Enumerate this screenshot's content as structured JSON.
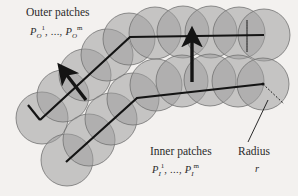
{
  "figure": {
    "background_color": "#f3f1ef",
    "circle_fill": "#9e9e9e",
    "circle_stroke": "#6e6e6e",
    "line_color": "#141414",
    "text_color": "#2b2b2b"
  },
  "labels": {
    "outer_title": "Outer patches",
    "outer_formula": {
      "base": "P",
      "sub": "O",
      "sup_first": "1",
      "dots": ", ..., ",
      "sup_last": "m"
    },
    "inner_title": "Inner patches",
    "inner_formula": {
      "base": "P",
      "sub": "I",
      "sup_first": "1",
      "dots": ", ..., ",
      "sup_last": "m"
    },
    "radius_title": "Radius",
    "radius_symbol": "r"
  },
  "chart_data": {
    "type": "scatter",
    "xlabel": "",
    "ylabel": "",
    "xlim": [
      0,
      298
    ],
    "ylim": [
      0,
      196
    ],
    "grid": false,
    "legend": "none",
    "radius": 26,
    "series": [
      {
        "name": "Outer patches",
        "note": "Upper/outer chain of circle centers, running from lower-left diagonally up then horizontally right",
        "centers": [
          [
            42,
            118
          ],
          [
            63,
            96
          ],
          [
            85,
            75
          ],
          [
            107,
            55
          ],
          [
            129,
            39
          ],
          [
            155,
            33
          ],
          [
            183,
            32
          ],
          [
            211,
            32
          ],
          [
            239,
            33
          ],
          [
            264,
            35
          ]
        ]
      },
      {
        "name": "Inner patches",
        "note": "Lower/inner chain of circle centers, parallel and offset inward from the outer chain",
        "centers": [
          [
            67,
            160
          ],
          [
            89,
            140
          ],
          [
            111,
            119
          ],
          [
            133,
            99
          ],
          [
            156,
            85
          ],
          [
            182,
            81
          ],
          [
            210,
            80
          ],
          [
            238,
            81
          ],
          [
            263,
            84
          ]
        ]
      }
    ],
    "polylines": [
      {
        "name": "outer-path",
        "points": [
          [
            40,
            120
          ],
          [
            130,
            37
          ],
          [
            264,
            35
          ]
        ]
      },
      {
        "name": "inner-path",
        "points": [
          [
            66,
            162
          ],
          [
            137,
            98
          ],
          [
            263,
            84
          ]
        ]
      }
    ],
    "normal_arrows": [
      {
        "name": "left-normal-arrow",
        "from": [
          86,
          100
        ],
        "to": [
          66,
          74
        ]
      },
      {
        "name": "right-normal-arrow",
        "from": [
          192,
          82
        ],
        "to": [
          192,
          40
        ]
      }
    ],
    "radius_indicator": {
      "name": "radius-dotted-line",
      "center": [
        263,
        84
      ],
      "edge": [
        284,
        104
      ],
      "leader_from": [
        268,
        100
      ],
      "leader_to": [
        248,
        142
      ]
    },
    "corner_marks": [
      {
        "name": "top-right-dotted-corner",
        "points": [
          [
            247,
            20
          ],
          [
            247,
            52
          ],
          [
            247,
            20
          ]
        ]
      }
    ]
  }
}
